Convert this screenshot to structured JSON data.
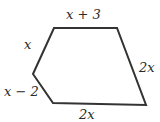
{
  "figure": {
    "shape": "pentagon",
    "stroke_color": "#333333",
    "vertices": [
      [
        54,
        28
      ],
      [
        117,
        28
      ],
      [
        146,
        105
      ],
      [
        53,
        103
      ],
      [
        33,
        74
      ]
    ],
    "labels": {
      "top": "x + 3",
      "upper_left": "x",
      "lower_left": "x − 2",
      "bottom": "2x",
      "right": "2x"
    }
  }
}
